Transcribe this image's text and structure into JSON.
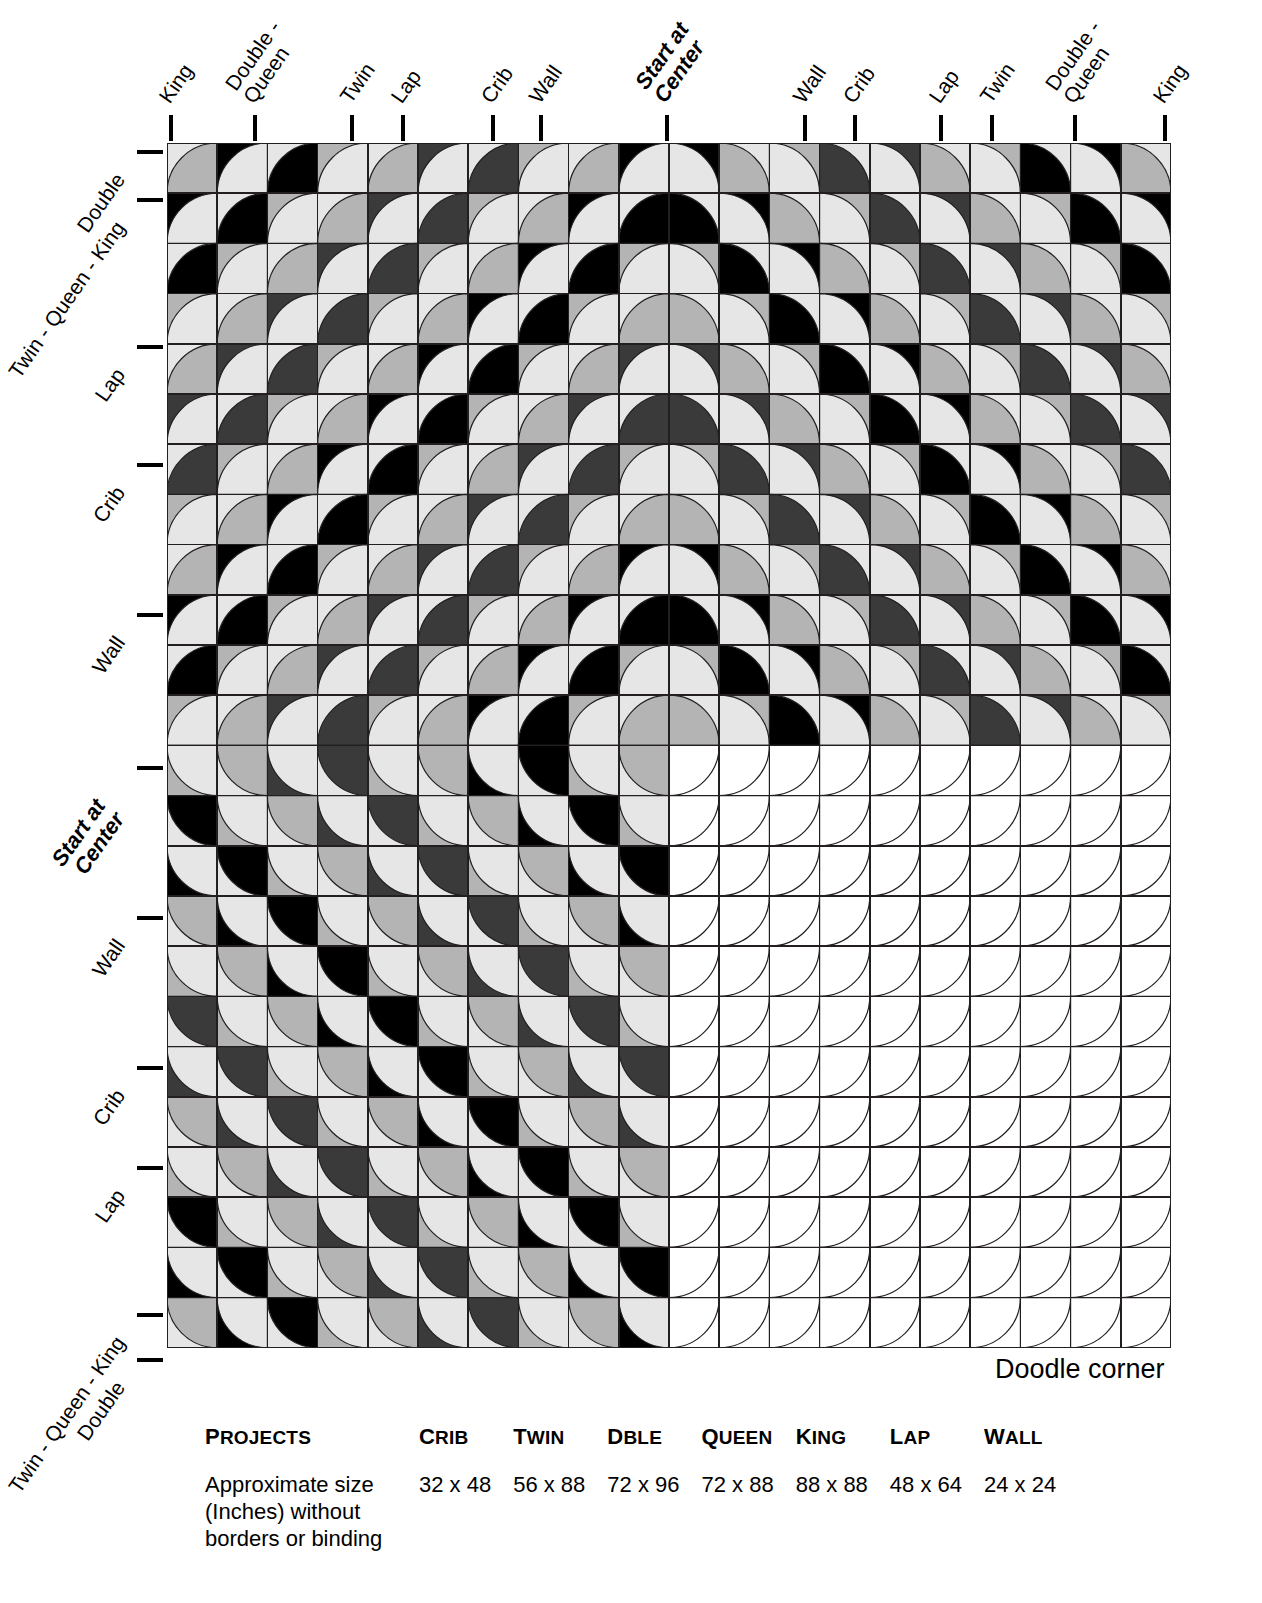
{
  "figure": {
    "type": "quilt-layout-diagram",
    "pattern_name": "Drunkard's Path concentric diamond",
    "doodle_corner_label": "Doodle corner",
    "start_at_center_label": "Start at\nCenter"
  },
  "grid": {
    "origin_x": 167,
    "origin_y": 143,
    "cell": 50.2,
    "cols": 20,
    "rows": 24,
    "center_col": 10,
    "center_row": 12,
    "stroke": "#231f20",
    "stroke_width": 1.6
  },
  "palette": {
    "white": "#ffffff",
    "light": "#e6e6e6",
    "medium": "#b4b4b4",
    "dark": "#3a3a3a",
    "black": "#000000",
    "outline": "#231f20"
  },
  "ring_colors": [
    "light",
    "medium",
    "light",
    "black",
    "light",
    "medium",
    "light",
    "dark",
    "light",
    "medium",
    "light",
    "black",
    "light",
    "medium",
    "light",
    "dark",
    "light",
    "medium",
    "light",
    "black",
    "light",
    "medium",
    "light",
    "dark",
    "light",
    "medium"
  ],
  "top_axis": [
    {
      "label": "King",
      "x": 171,
      "bold": false
    },
    {
      "label": "Double -\nQueen",
      "x": 255,
      "bold": false
    },
    {
      "label": "Twin",
      "x": 352,
      "bold": false
    },
    {
      "label": "Lap",
      "x": 403,
      "bold": false
    },
    {
      "label": "Crib",
      "x": 493,
      "bold": false
    },
    {
      "label": "Wall",
      "x": 541,
      "bold": false
    },
    {
      "label": "Start at\nCenter",
      "x": 667,
      "bold": true
    },
    {
      "label": "Wall",
      "x": 805,
      "bold": false
    },
    {
      "label": "Crib",
      "x": 855,
      "bold": false
    },
    {
      "label": "Lap",
      "x": 941,
      "bold": false
    },
    {
      "label": "Twin",
      "x": 992,
      "bold": false
    },
    {
      "label": "Double -\nQueen",
      "x": 1075,
      "bold": false
    },
    {
      "label": "King",
      "x": 1165,
      "bold": false
    }
  ],
  "left_axis": [
    {
      "label": "Double",
      "y": 152,
      "bold": false
    },
    {
      "label": "Twin - Queen - King",
      "y": 200,
      "bold": false
    },
    {
      "label": "Lap",
      "y": 347,
      "bold": false
    },
    {
      "label": "Crib",
      "y": 465,
      "bold": false
    },
    {
      "label": "Wall",
      "y": 615,
      "bold": false
    },
    {
      "label": "Start at\nCenter",
      "y": 768,
      "bold": true
    },
    {
      "label": "Wall",
      "y": 918,
      "bold": false
    },
    {
      "label": "Crib",
      "y": 1068,
      "bold": false
    },
    {
      "label": "Lap",
      "y": 1168,
      "bold": false
    },
    {
      "label": "Twin - Queen - King",
      "y": 1315,
      "bold": false
    },
    {
      "label": "Double",
      "y": 1360,
      "bold": false
    }
  ],
  "projects_table": {
    "row_header_label": "Projects",
    "lead_label": "Approximate size\n(Inches) without\nborders or binding",
    "columns": [
      {
        "name": "Crib",
        "size": "32 x 48"
      },
      {
        "name": "Twin",
        "size": "56 x 88"
      },
      {
        "name": "Dble",
        "size": "72 x 96"
      },
      {
        "name": "Queen",
        "size": "72 x 88"
      },
      {
        "name": "King",
        "size": "88 x 88"
      },
      {
        "name": "Lap",
        "size": "48 x 64"
      },
      {
        "name": "Wall",
        "size": "24 x 24"
      }
    ]
  },
  "chart_data": {
    "type": "table",
    "categories": [
      "Crib",
      "Twin",
      "Dble",
      "Queen",
      "King",
      "Lap",
      "Wall"
    ],
    "values": [
      "32 x 48",
      "56 x 88",
      "72 x 96",
      "72 x 88",
      "88 x 88",
      "48 x 64",
      "24 x 24"
    ],
    "xlabel": "Projects",
    "ylabel": "Approximate size (Inches) without borders or binding"
  }
}
